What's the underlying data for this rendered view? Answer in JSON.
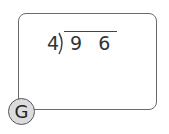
{
  "problem": {
    "divisor": "4",
    "dividend": "9 6",
    "operation": "long-division"
  },
  "badge": {
    "label": "G"
  },
  "colors": {
    "border": "#6a6a6a",
    "badge_fill": "#dcdcdc",
    "text": "#333333"
  }
}
